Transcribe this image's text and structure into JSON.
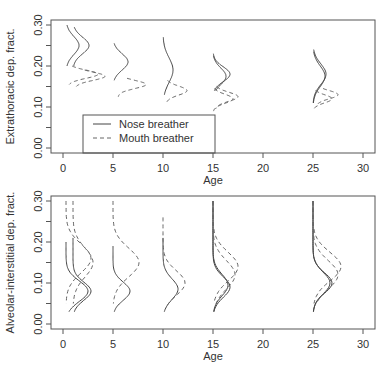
{
  "chart_data": [
    {
      "type": "line",
      "title": "",
      "xlabel": "Age",
      "ylabel": "Extrathoracic dep. fract.",
      "xlim": [
        -1.2,
        31.2
      ],
      "ylim": [
        -0.012,
        0.31
      ],
      "xticks": [
        "0",
        "5",
        "10",
        "15",
        "20",
        "25",
        "30"
      ],
      "yticks": [
        "0.00",
        "0.10",
        "0.20",
        "0.30"
      ],
      "grid": false,
      "legend": {
        "position": "bottom-left",
        "entries": [
          {
            "label": "Nose breather",
            "style": "solid"
          },
          {
            "label": "Mouth breather",
            "style": "dashed"
          }
        ]
      },
      "series": [
        {
          "name": "Nose breather",
          "curves": [
            {
              "age": 0.3,
              "ymin": 0.2,
              "ymax": 0.3,
              "peak_y": 0.25,
              "width": 1.3,
              "sd": 0.022
            },
            {
              "age": 1.0,
              "ymin": 0.2,
              "ymax": 0.295,
              "peak_y": 0.25,
              "width": 1.6,
              "sd": 0.02
            },
            {
              "age": 5.0,
              "ymin": 0.165,
              "ymax": 0.255,
              "peak_y": 0.21,
              "width": 1.5,
              "sd": 0.02
            },
            {
              "age": 10.0,
              "ymin": 0.13,
              "ymax": 0.27,
              "peak_y": 0.19,
              "width": 1.0,
              "sd": 0.03
            },
            {
              "age": 15.0,
              "ymin": 0.14,
              "ymax": 0.23,
              "peak_y": 0.18,
              "width": 1.7,
              "sd": 0.018
            },
            {
              "age": 15.0,
              "ymin": 0.14,
              "ymax": 0.225,
              "peak_y": 0.175,
              "width": 1.3,
              "sd": 0.02
            },
            {
              "age": 25.0,
              "ymin": 0.11,
              "ymax": 0.24,
              "peak_y": 0.18,
              "width": 1.3,
              "sd": 0.025
            },
            {
              "age": 25.0,
              "ymin": 0.11,
              "ymax": 0.235,
              "peak_y": 0.175,
              "width": 1.2,
              "sd": 0.025
            }
          ]
        },
        {
          "name": "Mouth breather",
          "curves": [
            {
              "age": 0.5,
              "ymin": 0.155,
              "ymax": 0.2,
              "peak_y": 0.18,
              "width": 3.0,
              "sd": 0.01
            },
            {
              "age": 1.2,
              "ymin": 0.15,
              "ymax": 0.19,
              "peak_y": 0.175,
              "width": 3.0,
              "sd": 0.01
            },
            {
              "age": 5.5,
              "ymin": 0.125,
              "ymax": 0.17,
              "peak_y": 0.155,
              "width": 2.8,
              "sd": 0.01
            },
            {
              "age": 10.3,
              "ymin": 0.11,
              "ymax": 0.165,
              "peak_y": 0.14,
              "width": 2.1,
              "sd": 0.011
            },
            {
              "age": 15.2,
              "ymin": 0.095,
              "ymax": 0.15,
              "peak_y": 0.125,
              "width": 2.3,
              "sd": 0.011
            },
            {
              "age": 15.0,
              "ymin": 0.09,
              "ymax": 0.145,
              "peak_y": 0.12,
              "width": 2.0,
              "sd": 0.011
            },
            {
              "age": 25.3,
              "ymin": 0.1,
              "ymax": 0.145,
              "peak_y": 0.13,
              "width": 2.2,
              "sd": 0.01
            },
            {
              "age": 25.0,
              "ymin": 0.095,
              "ymax": 0.14,
              "peak_y": 0.12,
              "width": 1.9,
              "sd": 0.01
            }
          ]
        }
      ]
    },
    {
      "type": "line",
      "title": "",
      "xlabel": "Age",
      "ylabel": "Alveolar-interstitial dep. fract.",
      "xlim": [
        -1.2,
        31.2
      ],
      "ylim": [
        -0.012,
        0.31
      ],
      "xticks": [
        "0",
        "5",
        "10",
        "15",
        "20",
        "25",
        "30"
      ],
      "yticks": [
        "0.00",
        "0.10",
        "0.20",
        "0.30"
      ],
      "grid": false,
      "series": [
        {
          "name": "Nose breather",
          "curves": [
            {
              "age": 0.3,
              "ymin": 0.03,
              "ymax": 0.2,
              "peak_y": 0.08,
              "width": 2.2,
              "sd": 0.025
            },
            {
              "age": 1.0,
              "ymin": 0.03,
              "ymax": 0.21,
              "peak_y": 0.08,
              "width": 1.8,
              "sd": 0.022
            },
            {
              "age": 5.0,
              "ymin": 0.03,
              "ymax": 0.19,
              "peak_y": 0.08,
              "width": 1.7,
              "sd": 0.022
            },
            {
              "age": 10.0,
              "ymin": 0.03,
              "ymax": 0.21,
              "peak_y": 0.085,
              "width": 1.5,
              "sd": 0.025
            },
            {
              "age": 15.0,
              "ymin": 0.03,
              "ymax": 0.3,
              "peak_y": 0.09,
              "width": 1.7,
              "sd": 0.025
            },
            {
              "age": 15.0,
              "ymin": 0.03,
              "ymax": 0.3,
              "peak_y": 0.095,
              "width": 1.5,
              "sd": 0.026
            },
            {
              "age": 25.0,
              "ymin": 0.03,
              "ymax": 0.3,
              "peak_y": 0.1,
              "width": 1.9,
              "sd": 0.025
            },
            {
              "age": 25.0,
              "ymin": 0.03,
              "ymax": 0.3,
              "peak_y": 0.1,
              "width": 1.7,
              "sd": 0.026
            }
          ]
        },
        {
          "name": "Mouth breather",
          "curves": [
            {
              "age": 0.3,
              "ymin": 0.05,
              "ymax": 0.3,
              "peak_y": 0.16,
              "width": 2.5,
              "sd": 0.035
            },
            {
              "age": 1.0,
              "ymin": 0.05,
              "ymax": 0.3,
              "peak_y": 0.15,
              "width": 2.0,
              "sd": 0.035
            },
            {
              "age": 5.0,
              "ymin": 0.05,
              "ymax": 0.3,
              "peak_y": 0.15,
              "width": 2.6,
              "sd": 0.035
            },
            {
              "age": 10.0,
              "ymin": 0.04,
              "ymax": 0.26,
              "peak_y": 0.1,
              "width": 2.2,
              "sd": 0.03
            },
            {
              "age": 15.0,
              "ymin": 0.05,
              "ymax": 0.3,
              "peak_y": 0.14,
              "width": 2.5,
              "sd": 0.035
            },
            {
              "age": 15.0,
              "ymin": 0.05,
              "ymax": 0.3,
              "peak_y": 0.12,
              "width": 2.2,
              "sd": 0.035
            },
            {
              "age": 25.0,
              "ymin": 0.05,
              "ymax": 0.3,
              "peak_y": 0.14,
              "width": 2.8,
              "sd": 0.035
            },
            {
              "age": 25.0,
              "ymin": 0.05,
              "ymax": 0.3,
              "peak_y": 0.12,
              "width": 2.5,
              "sd": 0.035
            }
          ]
        }
      ]
    }
  ]
}
